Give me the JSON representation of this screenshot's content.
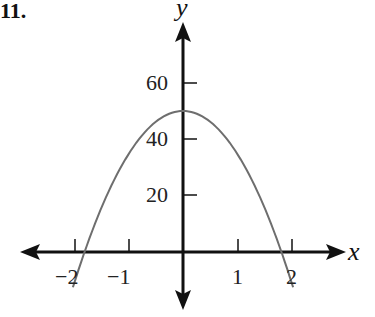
{
  "problem_label": "11.",
  "chart_data": {
    "type": "line",
    "title": "",
    "xlabel": "x",
    "ylabel": "y",
    "function": "parabola opening downward, vertex (0, 50), zeros near x = -1.8 and x = 1.8",
    "x": [
      -2.0,
      -1.8,
      -1.5,
      -1.0,
      -0.5,
      0,
      0.5,
      1.0,
      1.5,
      1.8,
      2.0
    ],
    "y": [
      -11.7,
      0,
      15.3,
      34.6,
      46.1,
      50,
      46.1,
      34.6,
      15.3,
      0,
      -11.7
    ],
    "x_ticks": [
      "-2",
      "-1",
      "1",
      "2"
    ],
    "y_ticks": [
      "20",
      "40",
      "60"
    ],
    "xlim": [
      -3.3,
      3.0
    ],
    "ylim": [
      -20,
      80
    ],
    "grid": false,
    "legend": null
  },
  "colors": {
    "axis": "#111111",
    "curve": "#6e6e6e"
  }
}
